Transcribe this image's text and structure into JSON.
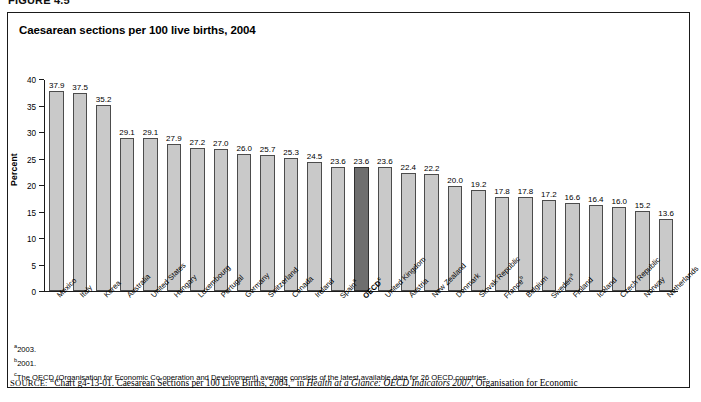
{
  "figure": {
    "tag": "FIGURE 4.5"
  },
  "chart_title": "Caesarean sections per 100 live births, 2004",
  "axis": {
    "ylabel": "Percent",
    "yticks": [
      "0",
      "5",
      "10",
      "15",
      "20",
      "25",
      "30",
      "35",
      "40"
    ]
  },
  "notes": {
    "a_marker": "a",
    "a_text": "2003.",
    "b_marker": "b",
    "b_text": "2001.",
    "c_marker": "c",
    "c_text": "The OECD (Organisation for Economic Co-operation and Development) average consists of the latest available data for 26 OECD countries."
  },
  "source": {
    "label": "SOURCE:",
    "pre": "“Chart g4-13-01. Caesarean Sections per 100 Live Births, 2004,” in ",
    "italic": "Health at a Glance: OECD Indicators 2007",
    "post": ", Organisation for Economic"
  },
  "chart_data": {
    "type": "bar",
    "title": "Caesarean sections per 100 live births, 2004",
    "xlabel": "",
    "ylabel": "Percent",
    "ylim": [
      0,
      40
    ],
    "ytick_step": 5,
    "grid": false,
    "legend": "none",
    "bar_color": "#c9c9c9",
    "highlight_color": "#6e6e6e",
    "highlight_category": "OECD",
    "categories": [
      "Mexico",
      "Italy",
      "Korea",
      "Australia",
      "United States",
      "Hungary",
      "Luxembourg",
      "Portugal",
      "Germany",
      "Switzerland",
      "Canada",
      "Ireland",
      "Spain",
      "OECD",
      "United Kingdom",
      "Austria",
      "New Zealand",
      "Denmark",
      "Slovak Republic",
      "France",
      "Belgium",
      "Sweden",
      "Finland",
      "Iceland",
      "Czech Republic",
      "Norway",
      "Netherlands"
    ],
    "category_markers": [
      "",
      "",
      "",
      "",
      "",
      "",
      "",
      "",
      "",
      "",
      "",
      "",
      "a",
      "c",
      "",
      "",
      "",
      "",
      "",
      "b",
      "",
      "a",
      "",
      "",
      "",
      "",
      ""
    ],
    "values": [
      37.9,
      37.5,
      35.2,
      29.1,
      29.1,
      27.9,
      27.2,
      27.0,
      26.0,
      25.7,
      25.3,
      24.5,
      23.6,
      23.6,
      23.6,
      22.4,
      22.2,
      20.0,
      19.2,
      17.8,
      17.8,
      17.2,
      16.6,
      16.4,
      16.0,
      15.2,
      13.6
    ],
    "value_labels": [
      "37.9",
      "37.5",
      "35.2",
      "29.1",
      "29.1",
      "27.9",
      "27.2",
      "27.0",
      "26.0",
      "25.7",
      "25.3",
      "24.5",
      "23.6",
      "23.6",
      "23.6",
      "22.4",
      "22.2",
      "20.0",
      "19.2",
      "17.8",
      "17.8",
      "17.2",
      "16.6",
      "16.4",
      "16.0",
      "15.2",
      "13.6"
    ]
  }
}
